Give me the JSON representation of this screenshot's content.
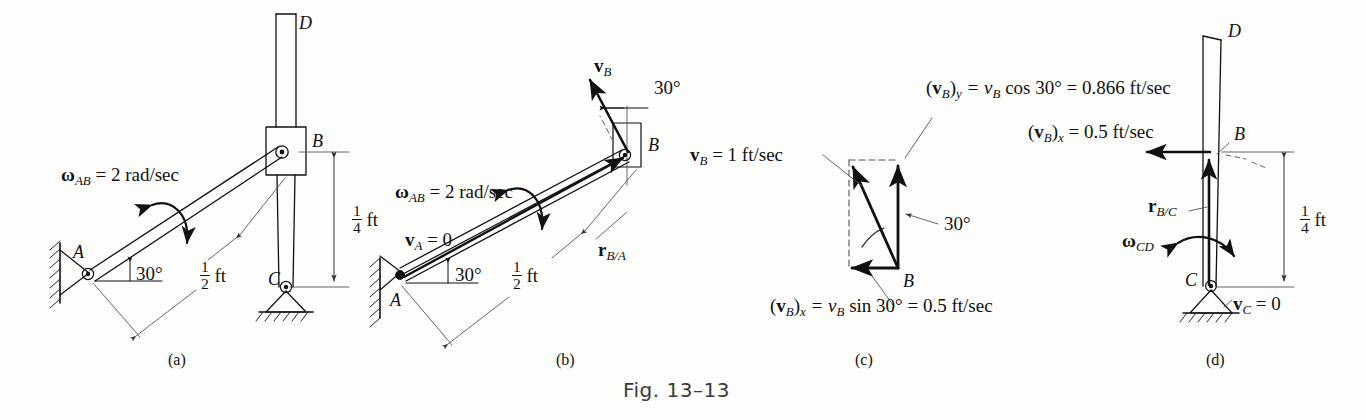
{
  "figure": {
    "caption": "Fig. 13–13",
    "panels": [
      {
        "id": "a",
        "label": "(a)"
      },
      {
        "id": "b",
        "label": "(b)"
      },
      {
        "id": "c",
        "label": "(c)"
      },
      {
        "id": "d",
        "label": "(d)"
      }
    ]
  },
  "panel_a": {
    "point_A": "A",
    "point_B": "B",
    "point_C": "C",
    "point_D": "D",
    "omega_AB_sym": "ω",
    "omega_AB_sub": "AB",
    "omega_AB_eq": " = 2 rad/sec",
    "angle_30": "30°",
    "dim_half_num": "1",
    "dim_half_den": "2",
    "dim_half_unit": "ft",
    "dim_quarter_num": "1",
    "dim_quarter_den": "4",
    "dim_quarter_unit": "ft"
  },
  "panel_b": {
    "point_A": "A",
    "point_B": "B",
    "omega_AB_sym": "ω",
    "omega_AB_sub": "AB",
    "omega_AB_eq": " = 2 rad/sec",
    "vA_sym": "v",
    "vA_sub": "A",
    "vA_eq": " = 0",
    "vB_sym": "v",
    "vB_sub": "B",
    "rBA_sym": "r",
    "rBA_sub": "B/A",
    "angle_30_rod": "30°",
    "angle_30_top": "30°",
    "dim_half_num": "1",
    "dim_half_den": "2",
    "dim_half_unit": "ft"
  },
  "panel_c": {
    "point_B": "B",
    "vB_sym": "v",
    "vB_sub": "B",
    "vB_eq": " = 1 ft/sec",
    "angle_30": "30°",
    "eq_y_lhs_open": "(",
    "eq_y_v": "v",
    "eq_y_subB": "B",
    "eq_y_close": ")",
    "eq_y_subY": "y",
    "eq_y_rhs": " = v",
    "eq_y_rhs_sub": "B",
    "eq_y_tail": "  cos 30° = 0.866 ft/sec",
    "eq_x_lhs_open": "(",
    "eq_x_v": "v",
    "eq_x_subB": "B",
    "eq_x_close": ")",
    "eq_x_subX": "x",
    "eq_x_rhs": " = v",
    "eq_x_rhs_sub": "B",
    "eq_x_tail": "  sin 30° = 0.5 ft/sec"
  },
  "panel_d": {
    "point_B": "B",
    "point_C": "C",
    "point_D": "D",
    "vBx_open": "(",
    "vBx_v": "v",
    "vBx_subB": "B",
    "vBx_close": ")",
    "vBx_subX": "x",
    "vBx_eq": " = 0.5 ft/sec",
    "rBC_sym": "r",
    "rBC_sub": "B/C",
    "omega_CD_sym": "ω",
    "omega_CD_sub": "CD",
    "vC_sym": "v",
    "vC_sub": "C",
    "vC_eq": " = 0",
    "dim_quarter_num": "1",
    "dim_quarter_den": "4",
    "dim_quarter_unit": "ft"
  },
  "colors": {
    "ink": "#111111",
    "thin": "#555555",
    "paper": "#fdfdfb"
  }
}
